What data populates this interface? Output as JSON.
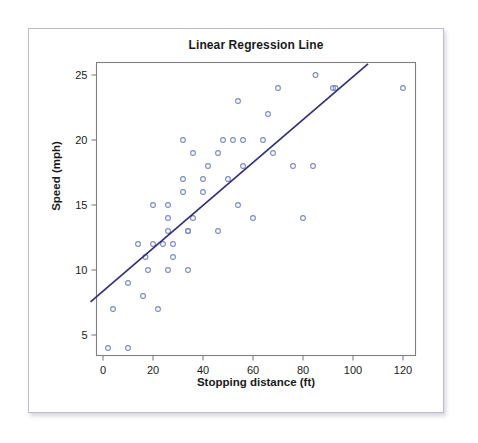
{
  "chart_data": {
    "type": "scatter",
    "title": "Linear Regression Line",
    "xlabel": "Stopping distance (ft)",
    "ylabel": "Speed (mph)",
    "xlim": [
      -6,
      126
    ],
    "ylim": [
      2.8,
      25.9
    ],
    "xticks": [
      0,
      20,
      40,
      60,
      80,
      100,
      120
    ],
    "yticks": [
      5,
      10,
      15,
      20,
      25
    ],
    "xticklabels": [
      "0",
      "20",
      "40",
      "60",
      "80",
      "100",
      "120"
    ],
    "yticklabels": [
      "5",
      "10",
      "15",
      "20",
      "25"
    ],
    "grid": false,
    "legend": null,
    "point_color": "#7b8ac4",
    "line_color": "#30307e",
    "frame_color": "#808080",
    "series": [
      {
        "name": "Speed vs stopping distance",
        "marker": "open-circle",
        "x": [
          2,
          10,
          4,
          22,
          16,
          10,
          18,
          26,
          34,
          17,
          28,
          14,
          20,
          24,
          28,
          26,
          34,
          34,
          46,
          26,
          36,
          60,
          80,
          20,
          26,
          54,
          32,
          40,
          32,
          40,
          50,
          42,
          56,
          76,
          84,
          36,
          46,
          68,
          32,
          48,
          52,
          56,
          64,
          66,
          54,
          70,
          92,
          93,
          120,
          85
        ],
        "y": [
          4,
          4,
          7,
          7,
          8,
          9,
          10,
          10,
          10,
          11,
          11,
          12,
          12,
          12,
          12,
          13,
          13,
          13,
          13,
          14,
          14,
          14,
          14,
          15,
          15,
          15,
          16,
          16,
          17,
          17,
          17,
          18,
          18,
          18,
          18,
          19,
          19,
          19,
          20,
          20,
          20,
          20,
          20,
          22,
          23,
          24,
          24,
          24,
          24,
          25
        ]
      }
    ],
    "regression_line": {
      "name": "Linear regression line",
      "x_start": -5,
      "y_start": 7.55,
      "x_end": 106,
      "y_end": 25.85,
      "slope": 0.1656,
      "intercept": 8.38
    }
  },
  "figure": {
    "background": "#ffffff",
    "card_border": "#b9bcd2"
  }
}
